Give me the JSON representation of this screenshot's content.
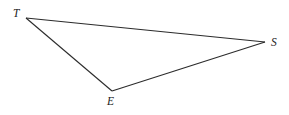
{
  "diagram": {
    "type": "triangle",
    "vertices": [
      {
        "id": "T",
        "label": "T",
        "x": 26,
        "y": 18,
        "label_x": 13,
        "label_y": 17
      },
      {
        "id": "E",
        "label": "E",
        "x": 112,
        "y": 91,
        "label_x": 107,
        "label_y": 105
      },
      {
        "id": "S",
        "label": "S",
        "x": 265,
        "y": 42,
        "label_x": 271,
        "label_y": 46
      }
    ],
    "edges": [
      {
        "from": "T",
        "to": "S"
      },
      {
        "from": "T",
        "to": "E"
      },
      {
        "from": "E",
        "to": "S"
      }
    ],
    "colors": {
      "stroke": "#2b2b2b",
      "label": "#222222",
      "background": "#ffffff"
    }
  }
}
